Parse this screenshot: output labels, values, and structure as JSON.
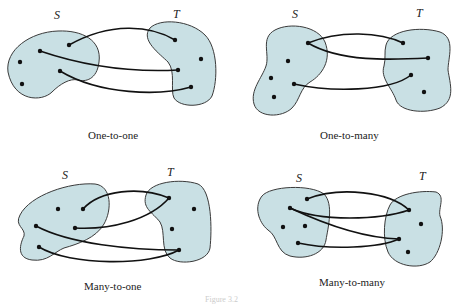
{
  "figure": {
    "colors": {
      "set_fill": "#c9e0e4",
      "set_stroke": "#3a3a3a",
      "edge": "#111111",
      "point": "#111111"
    },
    "caption": "Figure 3.2",
    "panels": [
      {
        "id": "one-to-one",
        "caption": "One-to-one",
        "domain_label": "S",
        "codomain_label": "T",
        "domain_points": [
          [
            69,
            45
          ],
          [
            40,
            51
          ],
          [
            20,
            62
          ],
          [
            60,
            71
          ],
          [
            22,
            84
          ]
        ],
        "codomain_points": [
          [
            175,
            40
          ],
          [
            201,
            59
          ],
          [
            178,
            70
          ],
          [
            191,
            87
          ]
        ],
        "mappings": [
          [
            0,
            0
          ],
          [
            1,
            2
          ],
          [
            3,
            3
          ]
        ]
      },
      {
        "id": "one-to-many",
        "caption": "One-to-many",
        "domain_label": "S",
        "codomain_label": "T",
        "domain_points": [
          [
            308,
            43
          ],
          [
            288,
            61
          ],
          [
            271,
            78
          ],
          [
            294,
            84
          ],
          [
            274,
            97
          ]
        ],
        "codomain_points": [
          [
            403,
            43
          ],
          [
            428,
            58
          ],
          [
            411,
            75
          ],
          [
            424,
            92
          ]
        ],
        "mappings": [
          [
            0,
            0
          ],
          [
            0,
            1
          ],
          [
            3,
            2
          ]
        ]
      },
      {
        "id": "many-to-one",
        "caption": "Many-to-one",
        "domain_label": "S",
        "codomain_label": "T",
        "domain_points": [
          [
            58,
            209
          ],
          [
            83,
            209
          ],
          [
            36,
            226
          ],
          [
            75,
            228
          ],
          [
            39,
            247
          ]
        ],
        "codomain_points": [
          [
            169,
            198
          ],
          [
            194,
            209
          ],
          [
            172,
            229
          ],
          [
            179,
            250
          ]
        ],
        "mappings": [
          [
            1,
            0
          ],
          [
            3,
            0
          ],
          [
            2,
            3
          ],
          [
            4,
            3
          ]
        ]
      },
      {
        "id": "many-to-many",
        "caption": "Many-to-many",
        "domain_label": "S",
        "codomain_label": "T",
        "domain_points": [
          [
            307,
            199
          ],
          [
            290,
            208
          ],
          [
            283,
            227
          ],
          [
            305,
            226
          ],
          [
            298,
            243
          ]
        ],
        "codomain_points": [
          [
            409,
            210
          ],
          [
            421,
            224
          ],
          [
            399,
            239
          ],
          [
            408,
            252
          ]
        ],
        "mappings": [
          [
            0,
            0
          ],
          [
            1,
            0
          ],
          [
            1,
            2
          ],
          [
            4,
            2
          ]
        ]
      }
    ]
  }
}
